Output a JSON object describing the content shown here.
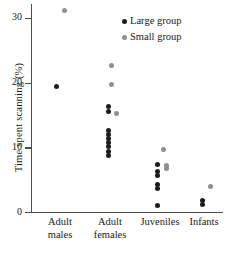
{
  "chart_data": {
    "type": "scatter",
    "title": "",
    "xlabel": "",
    "ylabel": "Time spent scanning (%)",
    "ylim": [
      0,
      33
    ],
    "yticks": [
      0,
      10,
      20,
      30
    ],
    "ytick_labels": [
      "0",
      "10",
      "20",
      "30"
    ],
    "grid": false,
    "categories": [
      "Adult males",
      "Adult females",
      "Juveniles",
      "Infants"
    ],
    "category_lines": [
      {
        "line1": "Adult",
        "line2": "males"
      },
      {
        "line1": "Adult",
        "line2": "females"
      },
      {
        "line1": "Juveniles",
        "line2": ""
      },
      {
        "line1": "Infants",
        "line2": ""
      }
    ],
    "legend": {
      "position": "top-right",
      "entries": [
        {
          "name": "Large group",
          "color": "#1c1c1c"
        },
        {
          "name": "Small group",
          "color": "#8f8f8f"
        }
      ]
    },
    "series": [
      {
        "name": "Large group",
        "color": "#1c1c1c",
        "points": [
          {
            "category": "Adult males",
            "x_offset": -0.07,
            "value": 19.4
          },
          {
            "category": "Adult females",
            "x_offset": -0.04,
            "value": 16.3
          },
          {
            "category": "Adult females",
            "x_offset": -0.04,
            "value": 15.5
          },
          {
            "category": "Adult females",
            "x_offset": -0.04,
            "value": 12.6
          },
          {
            "category": "Adult females",
            "x_offset": -0.04,
            "value": 12.0
          },
          {
            "category": "Adult females",
            "x_offset": -0.04,
            "value": 11.4
          },
          {
            "category": "Adult females",
            "x_offset": -0.04,
            "value": 10.8
          },
          {
            "category": "Adult females",
            "x_offset": -0.04,
            "value": 10.2
          },
          {
            "category": "Adult females",
            "x_offset": -0.04,
            "value": 9.4
          },
          {
            "category": "Adult females",
            "x_offset": -0.04,
            "value": 8.7
          },
          {
            "category": "Juveniles",
            "x_offset": -0.05,
            "value": 7.4
          },
          {
            "category": "Juveniles",
            "x_offset": -0.05,
            "value": 6.2
          },
          {
            "category": "Juveniles",
            "x_offset": -0.05,
            "value": 5.6
          },
          {
            "category": "Juveniles",
            "x_offset": -0.05,
            "value": 4.3
          },
          {
            "category": "Juveniles",
            "x_offset": -0.05,
            "value": 3.6
          },
          {
            "category": "Juveniles",
            "x_offset": -0.05,
            "value": 1.0
          },
          {
            "category": "Infants",
            "x_offset": -0.03,
            "value": 1.8
          },
          {
            "category": "Infants",
            "x_offset": -0.03,
            "value": 1.1
          }
        ]
      },
      {
        "name": "Small group",
        "color": "#8f8f8f",
        "points": [
          {
            "category": "Adult males",
            "x_offset": 0.09,
            "value": 31.1
          },
          {
            "category": "Adult females",
            "x_offset": 0.02,
            "value": 22.7
          },
          {
            "category": "Adult females",
            "x_offset": 0.02,
            "value": 19.7
          },
          {
            "category": "Adult females",
            "x_offset": 0.12,
            "value": 15.3
          },
          {
            "category": "Juveniles",
            "x_offset": 0.07,
            "value": 9.7
          },
          {
            "category": "Juveniles",
            "x_offset": 0.12,
            "value": 7.2
          },
          {
            "category": "Juveniles",
            "x_offset": 0.12,
            "value": 6.7
          },
          {
            "category": "Infants",
            "x_offset": 0.12,
            "value": 3.9
          }
        ]
      }
    ]
  }
}
